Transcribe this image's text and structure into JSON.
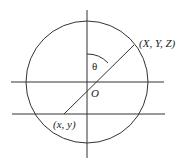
{
  "diagram": {
    "labels": {
      "theta": "θ",
      "origin": "O",
      "world_point": "(X, Y, Z)",
      "image_point": "(x, y)"
    },
    "colors": {
      "line": "#333333",
      "background": "#ffffff"
    }
  }
}
